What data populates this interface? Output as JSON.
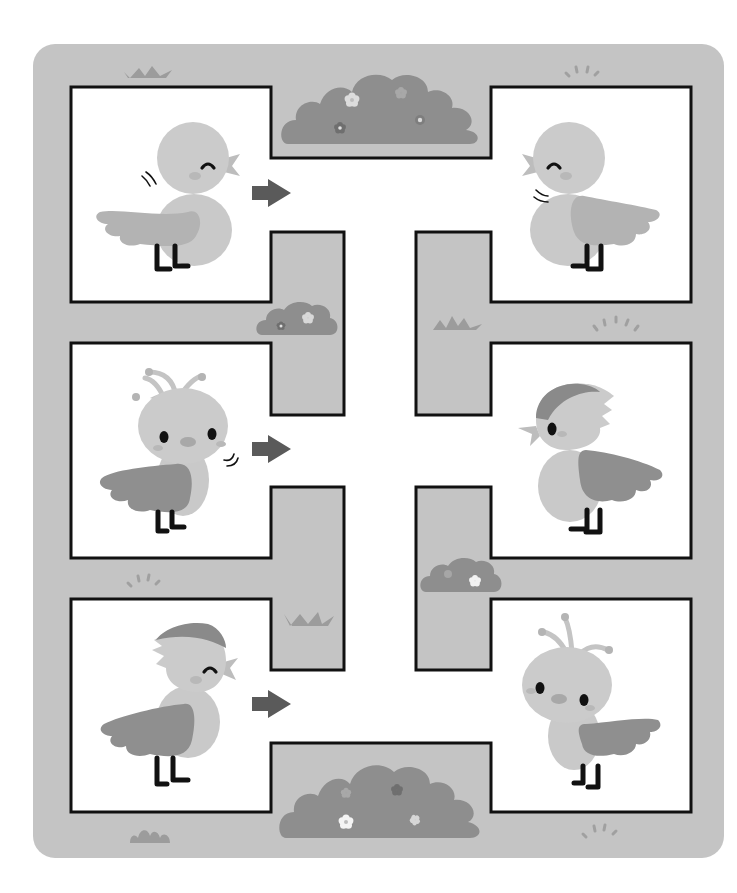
{
  "puzzle": {
    "type": "bird maze",
    "rows": 3,
    "columns": 2,
    "colors": {
      "background": "#ffffff",
      "board": "#c4c4c4",
      "path": "#ffffff",
      "wall": "#111111",
      "bush": "#8e8e8e",
      "grass": "#9c9c9c",
      "arrow": "#5a5a5a",
      "bird_body": "#c9c9c9",
      "bird_wing_light": "#b3b3b3",
      "bird_wing_dark": "#8f8f8f",
      "bird_cap": "#8a8a8a",
      "legs": "#111111"
    }
  },
  "birds": [
    {
      "id": "bird-1",
      "side": "left",
      "row": 1,
      "style": "plain-chick",
      "facing": "right",
      "eyes": "happy-closed",
      "arrow": "right"
    },
    {
      "id": "bird-2",
      "side": "right",
      "row": 1,
      "style": "plain-chick",
      "facing": "left",
      "eyes": "happy-closed",
      "arrow": null
    },
    {
      "id": "bird-3",
      "side": "left",
      "row": 2,
      "style": "antenna-chick",
      "facing": "front",
      "eyes": "open",
      "arrow": "right"
    },
    {
      "id": "bird-4",
      "side": "right",
      "row": 2,
      "style": "capped-bird",
      "facing": "left",
      "eyes": "open",
      "arrow": null
    },
    {
      "id": "bird-5",
      "side": "left",
      "row": 3,
      "style": "capped-bird",
      "facing": "right",
      "eyes": "happy-closed",
      "arrow": "right"
    },
    {
      "id": "bird-6",
      "side": "right",
      "row": 3,
      "style": "antenna-chick",
      "facing": "front",
      "eyes": "open",
      "arrow": null
    }
  ],
  "decorations": [
    "bush-top",
    "bush-bottom",
    "bush-small-left",
    "bush-small-right",
    "grass-tuft-top-left",
    "grass-tuft-mid",
    "grass-tuft-lower",
    "grass-tuft-bottom-left",
    "sparkle-top-right",
    "sparkle-right",
    "sparkle-left",
    "sparkle-bottom-right"
  ]
}
